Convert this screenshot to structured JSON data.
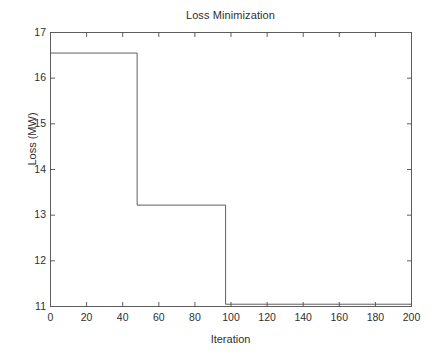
{
  "chart_data": {
    "type": "line",
    "title": "Loss Minimization",
    "xlabel": "Iteration",
    "ylabel": "Loss (MW)",
    "xlim": [
      0,
      200
    ],
    "ylim": [
      11,
      17
    ],
    "xticks": [
      0,
      20,
      40,
      60,
      80,
      100,
      120,
      140,
      160,
      180,
      200
    ],
    "yticks": [
      11,
      12,
      13,
      14,
      15,
      16,
      17
    ],
    "xtick_labels": [
      "0",
      "20",
      "40",
      "60",
      "80",
      "100",
      "120",
      "140",
      "160",
      "180",
      "200"
    ],
    "ytick_labels": [
      "11",
      "12",
      "13",
      "14",
      "15",
      "16",
      "17"
    ],
    "grid": false,
    "legend": null,
    "line_color": "#4d4d4d",
    "background_color": "#ffffff",
    "series": [
      {
        "name": "Loss",
        "style": "step-post",
        "x": [
          0,
          48,
          48,
          97,
          97,
          200
        ],
        "y": [
          16.55,
          16.55,
          13.22,
          13.22,
          11.05,
          11.05
        ]
      }
    ],
    "steps": [
      {
        "from_iteration": 0,
        "to_iteration": 48,
        "loss": 16.55
      },
      {
        "from_iteration": 48,
        "to_iteration": 97,
        "loss": 13.22
      },
      {
        "from_iteration": 97,
        "to_iteration": 200,
        "loss": 11.05
      }
    ]
  }
}
